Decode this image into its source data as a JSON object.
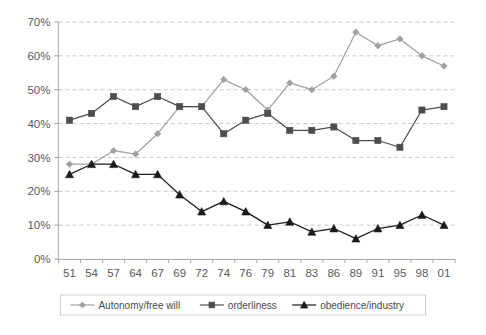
{
  "chart_data": {
    "type": "line",
    "title": "",
    "subtitle": "",
    "xlabel": "",
    "ylabel": "",
    "ylim": [
      0,
      70
    ],
    "ytick_labels": [
      "0%",
      "10%",
      "20%",
      "30%",
      "40%",
      "50%",
      "60%",
      "70%"
    ],
    "ytick_values": [
      0,
      10,
      20,
      30,
      40,
      50,
      60,
      70
    ],
    "grid": true,
    "grid_style": "dashed-horizontal",
    "legend_position": "bottom",
    "categories": [
      "51",
      "54",
      "57",
      "64",
      "67",
      "69",
      "72",
      "74",
      "76",
      "79",
      "81",
      "83",
      "86",
      "89",
      "91",
      "95",
      "98",
      "01"
    ],
    "series": [
      {
        "name": "Autonomy/free will",
        "marker": "diamond",
        "color": "#a0a0a0",
        "values": [
          28,
          28,
          32,
          31,
          37,
          45,
          45,
          53,
          50,
          44,
          52,
          50,
          54,
          67,
          63,
          65,
          60,
          57
        ]
      },
      {
        "name": "orderliness",
        "marker": "square",
        "color": "#4d4d4d",
        "values": [
          41,
          43,
          48,
          45,
          48,
          45,
          45,
          37,
          41,
          43,
          38,
          38,
          39,
          35,
          35,
          33,
          44,
          45
        ]
      },
      {
        "name": "obedience/industry",
        "marker": "triangle",
        "color": "#1a1a1a",
        "values": [
          25,
          28,
          28,
          25,
          25,
          19,
          14,
          17,
          14,
          10,
          11,
          8,
          9,
          6,
          9,
          10,
          13,
          10
        ]
      }
    ]
  },
  "legend": {
    "items": [
      {
        "label": "Autonomy/free will",
        "marker": "diamond-marker",
        "color": "#a0a0a0"
      },
      {
        "label": "orderliness",
        "marker": "square-marker",
        "color": "#4d4d4d"
      },
      {
        "label": "obedience/industry",
        "marker": "triangle-marker",
        "color": "#1a1a1a"
      }
    ]
  },
  "axes": {
    "y_axis_name": "percent-axis",
    "x_axis_name": "year-axis"
  }
}
